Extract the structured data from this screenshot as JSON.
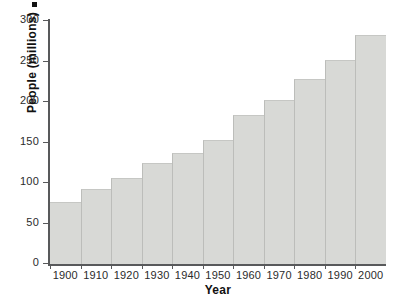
{
  "chart_data": {
    "type": "bar",
    "title": "",
    "xlabel": "Year",
    "ylabel": "People (millions)",
    "categories": [
      "1900",
      "1910",
      "1920",
      "1930",
      "1940",
      "1950",
      "1960",
      "1970",
      "1980",
      "1990",
      "2000"
    ],
    "values": [
      76,
      92,
      106,
      125,
      137,
      153,
      184,
      203,
      229,
      252,
      283
    ],
    "ylim": [
      0,
      300
    ],
    "yticks": [
      0,
      50,
      100,
      150,
      200,
      250,
      300
    ],
    "ytick_labels": [
      "0",
      "50",
      "100",
      "150",
      "200",
      "250",
      "300"
    ],
    "xtick_labels": [
      "1900",
      "1910",
      "1920",
      "1930",
      "1940",
      "1950",
      "1960",
      "1970",
      "1980",
      "1990",
      "2000"
    ],
    "grid": false,
    "legend": null,
    "bar_color": "#d8d9d6",
    "axis_color": "#58595b",
    "text_color": "#1a1a1a",
    "background": "#ffffff"
  },
  "axes": {
    "x_title": "Year",
    "y_title": "People (millions)"
  }
}
